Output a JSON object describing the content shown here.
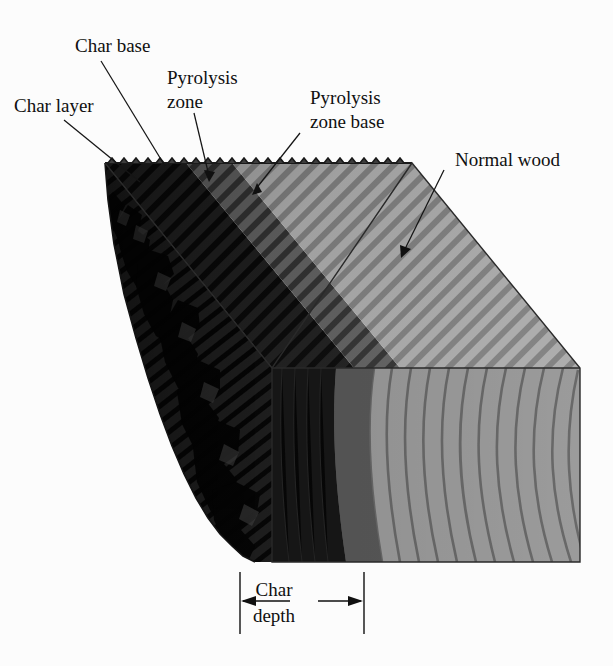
{
  "figure": {
    "background_color": "#fcfcfc",
    "width": 613,
    "height": 666
  },
  "labels": {
    "char_layer": "Char layer",
    "char_base": "Char base",
    "pyrolysis_zone_line1": "Pyrolysis",
    "pyrolysis_zone_line2": "zone",
    "pyrolysis_zone_base_line1": "Pyrolysis",
    "pyrolysis_zone_base_line2": "zone base",
    "normal_wood": "Normal wood",
    "char_depth_line1": "Char",
    "char_depth_line2": "depth"
  },
  "zones": {
    "char": {
      "name": "Char layer",
      "color": "#1c1c1c",
      "description": "Blackened, deeply fissured outer layer"
    },
    "pyrolysis": {
      "name": "Pyrolysis zone",
      "color": "#4a4a4a",
      "description": "Transition band between char and normal wood"
    },
    "normal_wood": {
      "name": "Normal wood",
      "color": "#9b9b9b",
      "description": "Undamaged wood with visible grain"
    }
  },
  "colors": {
    "background": "#fcfcfc",
    "char_dark": "#1c1c1c",
    "char_mid": "#2c2c2c",
    "pyrolysis_dark": "#3c3c3c",
    "pyrolysis_light": "#5a5a5a",
    "wood_light": "#a0a0a0",
    "wood_mid": "#8d8d8d",
    "grain_line": "#6a6a6a",
    "outline": "#2a2a2a",
    "text": "#101010"
  },
  "dimension": {
    "label": "Char depth",
    "left_extension_x": 240,
    "right_extension_x": 364,
    "arrow_y": 601
  }
}
